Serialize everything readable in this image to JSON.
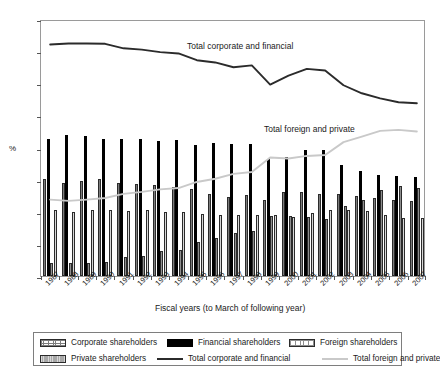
{
  "chart_data": {
    "type": "bar",
    "title": "",
    "xlabel": "Fiscal years (to March of following year)",
    "ylabel": "%",
    "ylim": [
      0,
      80
    ],
    "yticks": [
      0,
      10,
      20,
      30,
      40,
      50,
      60,
      70,
      80
    ],
    "grid": false,
    "legend_position": "bottom",
    "categories": [
      "1987",
      "1988",
      "1989",
      "1990",
      "1991",
      "1992",
      "1993",
      "1994",
      "1995",
      "1996",
      "1997",
      "1998",
      "1999",
      "2000",
      "2001",
      "2002",
      "2003",
      "2004",
      "2005",
      "2006",
      "2007"
    ],
    "series": [
      {
        "name": "Corporate shareholders",
        "type": "bar",
        "values": [
          30.2,
          29.0,
          29.5,
          30.1,
          29.0,
          28.6,
          28.3,
          27.7,
          27.0,
          25.6,
          24.6,
          25.2,
          23.7,
          26.0,
          26.0,
          25.5,
          25.5,
          24.8,
          24.3,
          23.7,
          23.5
        ]
      },
      {
        "name": "Financial shareholders",
        "type": "bar",
        "values": [
          42.5,
          44.0,
          43.5,
          42.8,
          42.6,
          42.5,
          42.0,
          42.2,
          40.8,
          41.5,
          41.0,
          41.0,
          36.5,
          37.0,
          39.1,
          39.1,
          34.5,
          32.7,
          31.6,
          31.0,
          30.9
        ]
      },
      {
        "name": "Foreign shareholders",
        "type": "bar",
        "values": [
          4.0,
          4.1,
          3.9,
          4.5,
          6.0,
          6.3,
          7.7,
          8.1,
          10.5,
          11.9,
          13.4,
          14.1,
          18.6,
          18.8,
          18.3,
          17.7,
          21.8,
          23.7,
          26.7,
          28.0,
          27.4
        ]
      },
      {
        "name": "Private shareholders",
        "type": "bar",
        "values": [
          20.4,
          19.9,
          20.5,
          20.4,
          20.2,
          20.5,
          19.9,
          19.9,
          19.4,
          19.0,
          19.0,
          18.9,
          18.9,
          18.4,
          19.7,
          20.6,
          20.5,
          20.3,
          19.1,
          18.1,
          18.2
        ]
      },
      {
        "name": "Total corporate and financial",
        "type": "line",
        "values": [
          72.7,
          73.0,
          73.0,
          72.9,
          71.5,
          71.1,
          70.3,
          69.9,
          67.8,
          67.1,
          65.6,
          66.2,
          60.2,
          63.0,
          65.1,
          64.6,
          60.0,
          57.5,
          55.9,
          54.7,
          54.4
        ]
      },
      {
        "name": "Total foreign and private",
        "type": "line",
        "values": [
          24.4,
          24.0,
          24.4,
          24.9,
          26.2,
          26.8,
          27.6,
          28.0,
          29.9,
          30.9,
          32.4,
          33.0,
          37.5,
          37.2,
          38.0,
          38.3,
          42.3,
          44.0,
          45.8,
          46.1,
          45.6
        ]
      }
    ],
    "annotations": [
      {
        "text": "Total corporate and financial",
        "x": 186,
        "y": 40
      },
      {
        "text": "Total foreign and private",
        "x": 263,
        "y": 123
      }
    ],
    "colors": {
      "financial": "#000000",
      "private": "#a8a8a8",
      "total_corporate_line": "#2b2b2b",
      "total_foreign_line": "#c9c9c9",
      "axis": "#9a9a9a"
    }
  },
  "legend": {
    "items": [
      {
        "label": "Corporate shareholders",
        "swatch": "corp"
      },
      {
        "label": "Financial shareholders",
        "swatch": "fin"
      },
      {
        "label": "Foreign shareholders",
        "swatch": "forg"
      },
      {
        "label": "Private shareholders",
        "swatch": "priv"
      },
      {
        "label": "Total corporate and financial",
        "swatch": "lineA"
      },
      {
        "label": "Total foreign and private",
        "swatch": "lineB"
      }
    ]
  }
}
